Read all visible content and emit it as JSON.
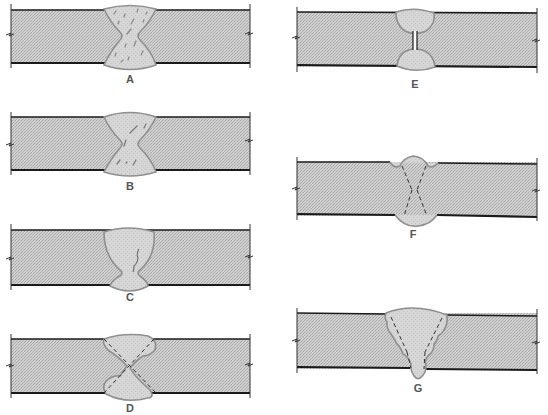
{
  "colors": {
    "plate_fill": "#c9c9c9",
    "plate_edge": "#1a1a1a",
    "weld_fill": "#d4d4d4",
    "weld_outline": "#8f8f8f",
    "label": "#555555",
    "background": "#ffffff"
  },
  "panels": [
    {
      "id": "A",
      "label": "A",
      "description": "Porosity throughout double-V weld"
    },
    {
      "id": "B",
      "label": "B",
      "description": "Slag inclusions in double-V weld"
    },
    {
      "id": "C",
      "label": "C",
      "description": "Crack in single-V weld with back bead"
    },
    {
      "id": "D",
      "label": "D",
      "description": "Lack of fusion / misaligned double-V weld with dashed groove lines"
    },
    {
      "id": "E",
      "label": "E",
      "description": "Incomplete penetration between top and bottom beads"
    },
    {
      "id": "F",
      "label": "F",
      "description": "Undercut at toes of double-V weld with dashed groove lines"
    },
    {
      "id": "G",
      "label": "G",
      "description": "Overlapping single-V multipass weld with dashed groove lines"
    }
  ]
}
